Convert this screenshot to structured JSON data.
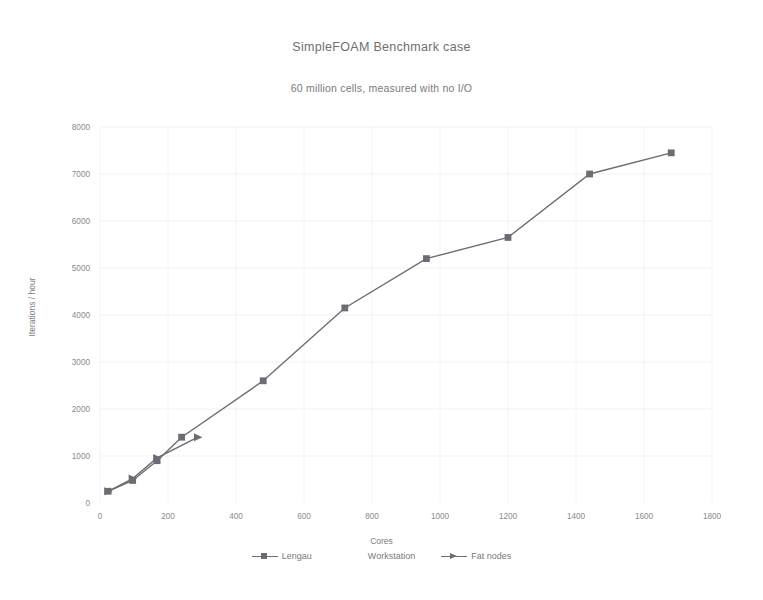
{
  "chart_data": {
    "type": "line",
    "title": "SimpleFOAM Benchmark case",
    "subtitle": "60 million cells, measured with no I/O",
    "xlabel": "Cores",
    "ylabel": "Iterations / hour",
    "xlim": [
      0,
      1800
    ],
    "ylim": [
      0,
      8000
    ],
    "xticks": [
      0,
      200,
      400,
      600,
      800,
      1000,
      1200,
      1400,
      1600,
      1800
    ],
    "yticks": [
      0,
      1000,
      2000,
      3000,
      4000,
      5000,
      6000,
      7000,
      8000
    ],
    "grid": "faint-vertical-and-horizontal",
    "legend_position": "bottom",
    "series": [
      {
        "name": "Lengau",
        "marker": "square",
        "color": "#6c6c74",
        "points": [
          [
            24,
            250
          ],
          [
            96,
            480
          ],
          [
            168,
            900
          ],
          [
            240,
            1400
          ],
          [
            480,
            2600
          ],
          [
            720,
            4150
          ],
          [
            960,
            5200
          ],
          [
            1200,
            5650
          ],
          [
            1440,
            7000
          ],
          [
            1680,
            7450
          ]
        ]
      },
      {
        "name": "Workstation",
        "marker": "none",
        "color": "#6c6c74",
        "points": []
      },
      {
        "name": "Fat nodes",
        "marker": "triangle",
        "color": "#6c6c74",
        "points": [
          [
            24,
            250
          ],
          [
            96,
            520
          ],
          [
            168,
            960
          ],
          [
            288,
            1400
          ]
        ]
      }
    ]
  },
  "chart": {
    "title": "SimpleFOAM Benchmark case",
    "subtitle": "60 million cells, measured with no I/O",
    "x_axis_title": "Cores",
    "y_axis_title": "Iterations / hour",
    "x_tick_labels": [
      "0",
      "200",
      "400",
      "600",
      "800",
      "1000",
      "1200",
      "1400",
      "1600",
      "1800"
    ],
    "y_tick_labels": [
      "0",
      "1000",
      "2000",
      "3000",
      "4000",
      "5000",
      "6000",
      "7000",
      "8000"
    ],
    "legend": [
      {
        "label": "Lengau",
        "marker": "square"
      },
      {
        "label": "Workstation",
        "marker": "none"
      },
      {
        "label": "Fat nodes",
        "marker": "triangle"
      }
    ],
    "accent_color": "#6c6c74",
    "text_color": "#7a7a7a"
  }
}
